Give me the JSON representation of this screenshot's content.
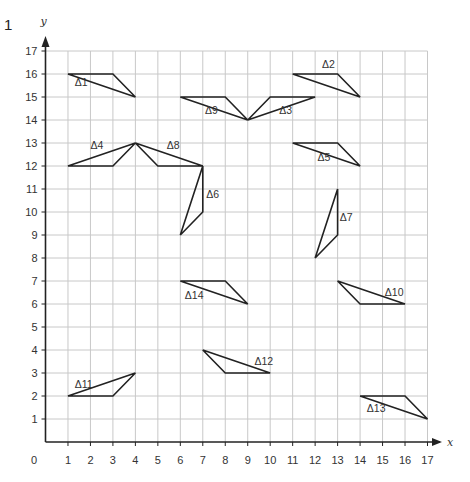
{
  "question_number": "1",
  "axes": {
    "x_label": "x",
    "y_label": "y",
    "origin_label": "0",
    "x_ticks": [
      "1",
      "2",
      "3",
      "4",
      "5",
      "6",
      "7",
      "8",
      "9",
      "10",
      "11",
      "12",
      "13",
      "14",
      "15",
      "16",
      "17"
    ],
    "y_ticks": [
      "1",
      "2",
      "3",
      "4",
      "5",
      "6",
      "7",
      "8",
      "9",
      "10",
      "11",
      "12",
      "13",
      "14",
      "15",
      "16",
      "17"
    ],
    "x_max": 17,
    "y_max": 17
  },
  "colors": {
    "grid": "#c8c8c8",
    "axis": "#222222",
    "shape": "#222222",
    "text": "#333333"
  },
  "triangles": [
    {
      "name": "Δ1",
      "points": [
        [
          1,
          16
        ],
        [
          3,
          16
        ],
        [
          4,
          15
        ]
      ],
      "label_pos": [
        1.3,
        15.5
      ]
    },
    {
      "name": "Δ2",
      "points": [
        [
          11,
          16
        ],
        [
          13,
          16
        ],
        [
          14,
          15
        ]
      ],
      "label_pos": [
        12.3,
        16.25
      ]
    },
    {
      "name": "Δ3",
      "points": [
        [
          9,
          14
        ],
        [
          10,
          15
        ],
        [
          12,
          15
        ]
      ],
      "label_pos": [
        10.4,
        14.25
      ]
    },
    {
      "name": "Δ4",
      "points": [
        [
          1,
          12
        ],
        [
          3,
          12
        ],
        [
          4,
          13
        ]
      ],
      "label_pos": [
        2.0,
        12.75
      ]
    },
    {
      "name": "Δ5",
      "points": [
        [
          11,
          13
        ],
        [
          13,
          13
        ],
        [
          14,
          12
        ]
      ],
      "label_pos": [
        12.1,
        12.2
      ]
    },
    {
      "name": "Δ6",
      "points": [
        [
          7,
          12
        ],
        [
          7,
          10
        ],
        [
          6,
          9
        ]
      ],
      "label_pos": [
        7.15,
        10.6
      ]
    },
    {
      "name": "Δ7",
      "points": [
        [
          13,
          11
        ],
        [
          13,
          9
        ],
        [
          12,
          8
        ]
      ],
      "label_pos": [
        13.1,
        9.6
      ]
    },
    {
      "name": "Δ8",
      "points": [
        [
          4,
          13
        ],
        [
          5,
          12
        ],
        [
          7,
          12
        ]
      ],
      "label_pos": [
        5.4,
        12.75
      ]
    },
    {
      "name": "Δ9",
      "points": [
        [
          6,
          15
        ],
        [
          8,
          15
        ],
        [
          9,
          14
        ]
      ],
      "label_pos": [
        7.1,
        14.25
      ]
    },
    {
      "name": "Δ10",
      "points": [
        [
          13,
          7
        ],
        [
          14,
          6
        ],
        [
          16,
          6
        ]
      ],
      "label_pos": [
        15.1,
        6.35
      ]
    },
    {
      "name": "Δ11",
      "points": [
        [
          1,
          2
        ],
        [
          3,
          2
        ],
        [
          4,
          3
        ]
      ],
      "label_pos": [
        1.3,
        2.35
      ]
    },
    {
      "name": "Δ12",
      "points": [
        [
          7,
          4
        ],
        [
          8,
          3
        ],
        [
          10,
          3
        ]
      ],
      "label_pos": [
        9.3,
        3.35
      ]
    },
    {
      "name": "Δ13",
      "points": [
        [
          14,
          2
        ],
        [
          16,
          2
        ],
        [
          17,
          1
        ]
      ],
      "label_pos": [
        14.3,
        1.3
      ]
    },
    {
      "name": "Δ14",
      "points": [
        [
          6,
          7
        ],
        [
          8,
          7
        ],
        [
          9,
          6
        ]
      ],
      "label_pos": [
        6.2,
        6.2
      ]
    }
  ]
}
